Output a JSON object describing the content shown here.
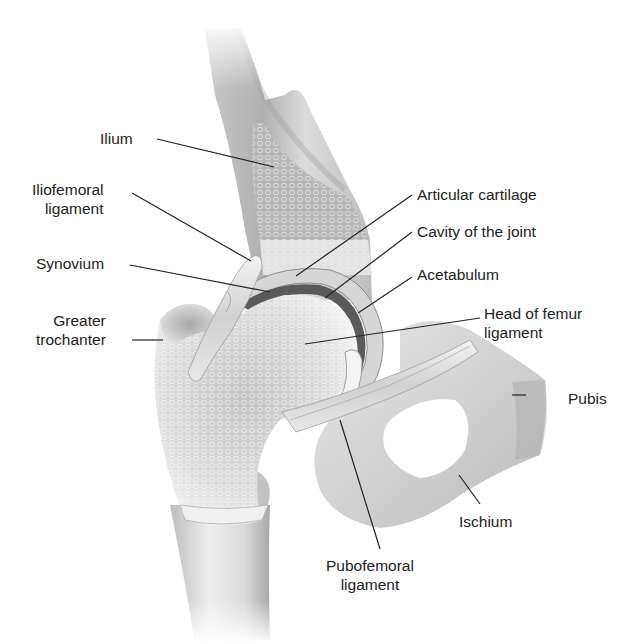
{
  "diagram": {
    "colors": {
      "background": "#ffffff",
      "bone_light": "#e9e9e9",
      "bone_mid": "#cfcfcf",
      "bone_dark": "#9a9a9a",
      "cavity": "#5a5a5a",
      "leader_line": "#222222",
      "text": "#222222"
    },
    "labels": {
      "ilium": "Ilium",
      "iliofemoral_1": "Iliofemoral",
      "iliofemoral_2": "ligament",
      "synovium": "Synovium",
      "greater_trochanter_1": "Greater",
      "greater_trochanter_2": "trochanter",
      "articular_cartilage": "Articular cartilage",
      "cavity_of_joint": "Cavity of the joint",
      "acetabulum": "Acetabulum",
      "head_of_femur_1": "Head of femur",
      "head_of_femur_2": "ligament",
      "pubis": "Pubis",
      "ischium": "Ischium",
      "pubofemoral_1": "Pubofemoral",
      "pubofemoral_2": "ligament"
    }
  }
}
